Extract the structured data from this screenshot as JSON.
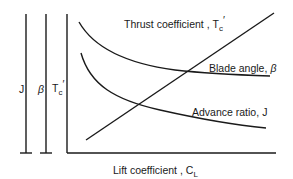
{
  "diagram": {
    "scale_bars": [
      {
        "label": "J",
        "x": 26
      },
      {
        "label": "β",
        "x": 46
      },
      {
        "label": "T",
        "sub": "c",
        "prime": "′",
        "x": 67
      }
    ],
    "x_axis": {
      "label": "Lift coefficient ,",
      "symbol": "C",
      "sub": "L"
    },
    "curves": [
      {
        "name": "thrust",
        "label": "Thrust coefficient ,",
        "symbol": "T",
        "sub": "c",
        "prime": "′"
      },
      {
        "name": "blade",
        "label": "Blade angle,",
        "symbol": "β"
      },
      {
        "name": "advance",
        "label": "Advance ratio,",
        "symbol": "J"
      }
    ]
  }
}
